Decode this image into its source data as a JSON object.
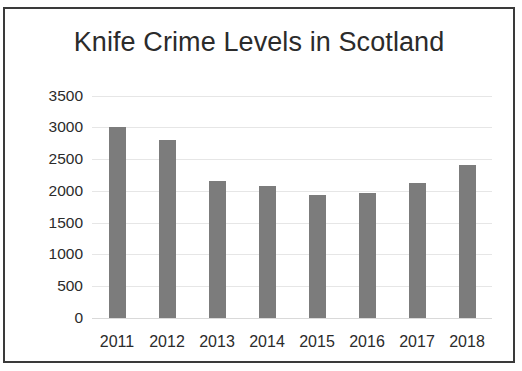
{
  "chart_data": {
    "type": "bar",
    "title": "Knife Crime Levels in Scotland",
    "xlabel": "",
    "ylabel": "",
    "categories": [
      "2011",
      "2012",
      "2013",
      "2014",
      "2015",
      "2016",
      "2017",
      "2018"
    ],
    "values": [
      3000,
      2800,
      2150,
      2080,
      1930,
      1970,
      2130,
      2400
    ],
    "ylim": [
      0,
      3500
    ],
    "yticks": [
      0,
      500,
      1000,
      1500,
      2000,
      2500,
      3000,
      3500
    ],
    "ytick_labels": [
      "0",
      "500",
      "1000",
      "1500",
      "2000",
      "2500",
      "3000",
      "3500"
    ],
    "grid": true,
    "legend": false,
    "bar_color": "#7c7c7c",
    "gridline_color": "#e6e6e6",
    "text_color": "#2b2b2b",
    "border_color": "#3a3a3a",
    "background_color": "#ffffff"
  }
}
